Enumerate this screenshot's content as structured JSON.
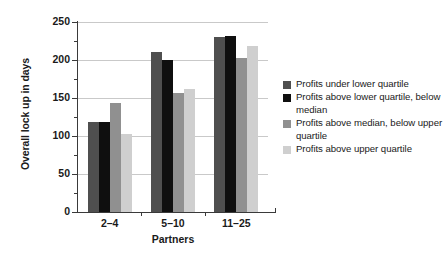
{
  "chart_data": {
    "type": "bar",
    "title": "",
    "xlabel": "Partners",
    "ylabel": "Overall lock up in days",
    "ylim": [
      0,
      250
    ],
    "ytick_values": [
      0,
      50,
      100,
      150,
      200,
      250
    ],
    "ytick_labels": [
      "0",
      "50",
      "100",
      "150",
      "200",
      "250"
    ],
    "yminor_values": [
      25,
      75,
      125,
      175,
      225
    ],
    "grid": "horizontal",
    "legend_position": "right",
    "categories": [
      "2–4",
      "5–10",
      "11–25"
    ],
    "series": [
      {
        "name": "Profits under lower quartile",
        "color": "#4f4f4f",
        "values": [
          119,
          210,
          230
        ]
      },
      {
        "name": "Profits above lower quartile, below median",
        "color": "#0f0f0f",
        "values": [
          119,
          200,
          231
        ]
      },
      {
        "name": "Profits above median, below upper quartile",
        "color": "#909090",
        "values": [
          143,
          157,
          202
        ]
      },
      {
        "name": "Profits above upper quartile",
        "color": "#cfcfcf",
        "values": [
          103,
          162,
          218
        ]
      }
    ]
  },
  "legend": {
    "items": [
      {
        "label": "Profits under lower quartile",
        "color": "#4f4f4f"
      },
      {
        "label": "Profits above lower quartile, below median",
        "color": "#0f0f0f"
      },
      {
        "label": "Profits above median, below upper quartile",
        "color": "#909090"
      },
      {
        "label": "Profits above upper quartile",
        "color": "#cfcfcf"
      }
    ]
  }
}
